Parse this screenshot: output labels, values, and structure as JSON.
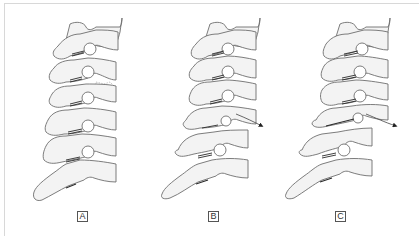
{
  "figure": {
    "panels": [
      {
        "id": "A",
        "label": "A",
        "description": "Cervical spine with fractured vertebral body",
        "has_fracture": true,
        "has_displacement_arrow": false
      },
      {
        "id": "B",
        "label": "B",
        "description": "Cervical spine with forward displacement of a vertebra",
        "has_fracture": false,
        "has_displacement_arrow": true
      },
      {
        "id": "C",
        "label": "C",
        "description": "Cervical spine with greater forward displacement of a vertebra",
        "has_fracture": false,
        "has_displacement_arrow": true
      }
    ],
    "colors": {
      "bone_fill": "#f3f3f3",
      "outline": "#6e6e6e",
      "joint": "#2a2a2a",
      "frame": "#d8d8d8"
    }
  }
}
